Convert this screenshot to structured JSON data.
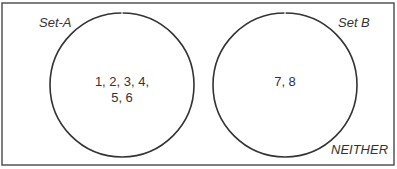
{
  "diagram": {
    "type": "venn",
    "universe_label": "NEITHER",
    "sets": [
      {
        "label": "Set-A",
        "elements_line1": "1, 2, 3, 4,",
        "elements_line2": "5, 6"
      },
      {
        "label": "Set B",
        "elements_line1": "7, 8",
        "elements_line2": ""
      }
    ]
  }
}
